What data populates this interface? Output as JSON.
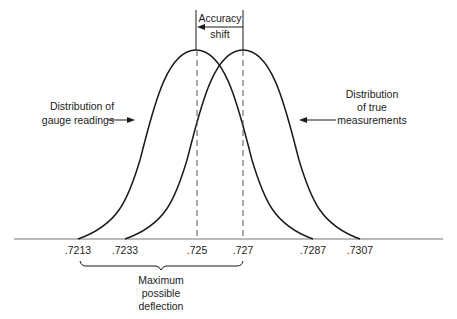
{
  "figure": {
    "type": "diagram"
  },
  "annotations": {
    "accuracy_shift": [
      "Accuracy",
      "shift"
    ],
    "gauge_readings": [
      "Distribution of",
      "gauge readings"
    ],
    "true_measurements": [
      "Distribution",
      "of true",
      "measurements"
    ],
    "max_deflection": [
      "Maximum",
      "possible",
      "deflection"
    ]
  },
  "axis": {
    "ticks": [
      {
        "label": ".7213",
        "x": 78
      },
      {
        "label": ".7233",
        "x": 125
      },
      {
        "label": ".725",
        "x": 197
      },
      {
        "label": ".727",
        "x": 243
      },
      {
        "label": ".7287",
        "x": 313
      },
      {
        "label": ".7307",
        "x": 360
      }
    ]
  },
  "curves": [
    {
      "name": "Distribution of gauge readings",
      "start": ".7213",
      "center": ".725",
      "end": ".7287"
    },
    {
      "name": "Distribution of true measurements",
      "start": ".7233",
      "center": ".727",
      "end": ".7307"
    }
  ],
  "colors": {
    "line": "#1a1a1a",
    "dashed": "#555555",
    "baseline": "#777777"
  }
}
